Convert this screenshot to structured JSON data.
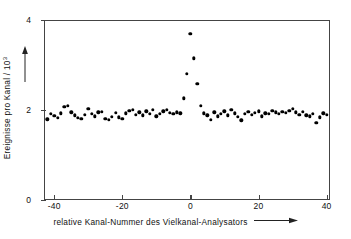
{
  "chart_data": {
    "type": "scatter",
    "title": "",
    "xlabel": "relative Kanal-Nummer des Vielkanal-Analysators",
    "ylabel": "Ereignisse pro Kanal / 10",
    "ylabel_exponent": "3",
    "xlim": [
      -43,
      41
    ],
    "ylim": [
      0,
      4
    ],
    "xticks": [
      -40,
      -20,
      0,
      20,
      40
    ],
    "xticklabels": [
      "-40",
      "-20",
      "0",
      "20",
      "40"
    ],
    "yticks": [
      0,
      2,
      4
    ],
    "yticklabels": [
      "0",
      "2",
      "4"
    ],
    "grid": false,
    "legend": false,
    "marker": "filled-circle",
    "marker_color": "#000000",
    "axis_color": "#444444",
    "background": "#ffffff",
    "x_axis_arrow": true,
    "y_axis_arrow": true,
    "x": [
      -42,
      -41,
      -40,
      -39,
      -38,
      -37,
      -36,
      -35,
      -34,
      -33,
      -32,
      -31,
      -30,
      -29,
      -28,
      -27,
      -26,
      -25,
      -24,
      -23,
      -22,
      -21,
      -20,
      -19,
      -18,
      -17,
      -16,
      -15,
      -14,
      -13,
      -12,
      -11,
      -10,
      -9,
      -8,
      -7,
      -6,
      -5,
      -4,
      -3,
      -2,
      -1,
      0,
      1,
      2,
      3,
      4,
      5,
      6,
      7,
      8,
      9,
      10,
      11,
      12,
      13,
      14,
      15,
      16,
      17,
      18,
      19,
      20,
      21,
      22,
      23,
      24,
      25,
      26,
      27,
      28,
      29,
      30,
      31,
      32,
      33,
      34,
      35,
      36,
      37,
      38,
      39,
      40
    ],
    "y": [
      1.79,
      1.91,
      1.87,
      1.82,
      1.93,
      2.07,
      2.1,
      1.95,
      1.88,
      1.83,
      1.8,
      1.9,
      2.03,
      1.92,
      1.86,
      1.95,
      1.96,
      1.81,
      1.78,
      1.85,
      1.94,
      1.84,
      1.8,
      1.93,
      1.98,
      2.01,
      1.9,
      1.95,
      1.88,
      1.97,
      1.92,
      2.0,
      1.86,
      1.91,
      1.97,
      2.01,
      1.94,
      1.92,
      1.95,
      1.93,
      2.26,
      2.81,
      3.7,
      3.15,
      2.58,
      2.1,
      1.93,
      1.88,
      1.78,
      1.95,
      1.86,
      1.92,
      1.97,
      1.88,
      2.0,
      1.93,
      1.85,
      1.77,
      1.91,
      1.96,
      1.9,
      1.94,
      1.97,
      1.86,
      1.93,
      1.91,
      1.98,
      1.95,
      1.92,
      1.96,
      1.94,
      1.98,
      2.02,
      1.95,
      1.89,
      1.96,
      1.88,
      1.86,
      1.91,
      1.72,
      1.84,
      1.93,
      1.9
    ]
  }
}
